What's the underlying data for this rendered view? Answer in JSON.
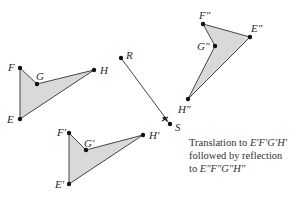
{
  "figure": {
    "type": "transformation diagram",
    "fill_color": "#d9d9d9",
    "stroke_color": "#444444",
    "point_color": "#111111"
  },
  "figures": {
    "original": {
      "name": "EFGH",
      "points": {
        "F": {
          "label": "F",
          "x": 20,
          "y": 68
        },
        "G": {
          "label": "G",
          "x": 37,
          "y": 84
        },
        "H": {
          "label": "H",
          "x": 94,
          "y": 70
        },
        "E": {
          "label": "E",
          "x": 20,
          "y": 119
        }
      }
    },
    "translated": {
      "name": "E′F′G′H′",
      "points": {
        "F": {
          "label": "F′",
          "x": 69,
          "y": 133
        },
        "G": {
          "label": "G′",
          "x": 86,
          "y": 150
        },
        "H": {
          "label": "H′",
          "x": 143,
          "y": 135
        },
        "E": {
          "label": "E′",
          "x": 69,
          "y": 184
        }
      }
    },
    "reflected": {
      "name": "E″F″G″H″",
      "points": {
        "F": {
          "label": "F″",
          "x": 203,
          "y": 24
        },
        "G": {
          "label": "G″",
          "x": 215,
          "y": 46
        },
        "E": {
          "label": "E″",
          "x": 250,
          "y": 37
        },
        "H": {
          "label": "H″",
          "x": 188,
          "y": 99
        }
      }
    }
  },
  "reflection_line": {
    "R": {
      "label": "R",
      "x": 121,
      "y": 58
    },
    "S": {
      "label": "S",
      "x": 170,
      "y": 124
    }
  },
  "caption": {
    "line1_text": "Translation to ",
    "line1_math": "E′F′G′H′",
    "line2_text": "followed by reflection",
    "line3_text": "to ",
    "line3_math": "E″F″G″H″"
  }
}
